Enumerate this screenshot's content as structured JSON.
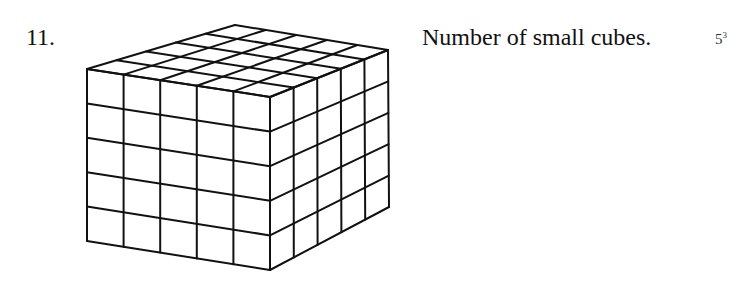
{
  "problem": {
    "number": "11.",
    "question": "Number of small cubes.",
    "answer_base": "5",
    "answer_exponent": "3"
  },
  "figure": {
    "type": "cube-grid",
    "divisions": 5,
    "stroke_color": "#111111"
  }
}
